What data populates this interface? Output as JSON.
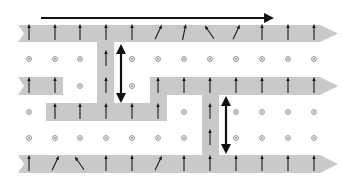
{
  "diagram": {
    "colors": {
      "band": "#c9c9c9",
      "arrow": "#1a1a1a",
      "dot": "#8a8a8a",
      "background": "#ffffff"
    },
    "grid": {
      "columns_x": [
        29,
        55,
        80,
        106,
        132,
        158,
        184,
        210,
        236,
        262,
        288,
        314
      ],
      "rows_y": [
        33,
        59,
        86,
        112,
        138,
        164
      ]
    },
    "rows": [
      [
        "up",
        "up",
        "up",
        "up",
        "up",
        "ne",
        "nne",
        "nw",
        "ne",
        "up",
        "up",
        "up"
      ],
      [
        "dot",
        "dot",
        "dot",
        "up",
        "dot",
        "dot",
        "dot",
        "dot",
        "dot",
        "dot",
        "dot",
        "dot"
      ],
      [
        "up",
        "up",
        "dot",
        "up",
        "dot",
        "up",
        "up",
        "up",
        "up",
        "up",
        "up",
        "up"
      ],
      [
        "dot",
        "up",
        "up",
        "up",
        "up",
        "up",
        "dot",
        "up",
        "dot",
        "dot",
        "dot",
        "dot"
      ],
      [
        "dot",
        "dot",
        "dot",
        "dot",
        "dot",
        "dot",
        "dot",
        "up",
        "dot",
        "dot",
        "dot",
        "dot"
      ],
      [
        "up",
        "ne",
        "nw",
        "up",
        "up",
        "ne",
        "up",
        "up",
        "up",
        "up",
        "up",
        "up"
      ]
    ],
    "flow_arrow": {
      "x1": 41,
      "x2": 272,
      "y": 18,
      "direction": "right"
    },
    "double_arrows": [
      {
        "name": "domain-width-arrow-1",
        "x": 121,
        "y1": 44,
        "y2": 103
      },
      {
        "name": "domain-width-arrow-2",
        "x": 226,
        "y1": 96,
        "y2": 154
      }
    ]
  }
}
